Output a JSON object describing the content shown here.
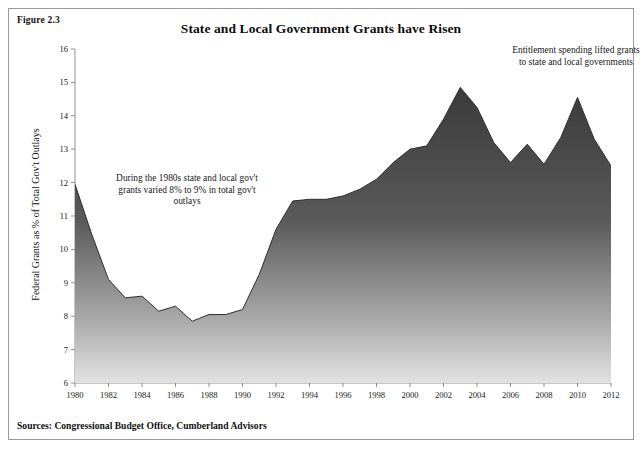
{
  "figure": {
    "label": "Figure 2.3",
    "title": "State and Local Government Grants have Risen",
    "sources": "Sources: Congressional Budget Office, Cumberland Advisors"
  },
  "annotations": {
    "left": "During the 1980s state and local gov't grants varied 8% to 9% in total gov't outlays",
    "right": "Entitlement spending lifted grants to state and local governments"
  },
  "colors": {
    "area_top": "#3b3b3b",
    "area_bottom": "#d8d8d8",
    "axis": "#8f8f8f",
    "text": "#141414",
    "border": "#9a9a9a",
    "background": "#ffffff"
  },
  "chart_data": {
    "type": "area",
    "title": "State and Local Government Grants have Risen",
    "xlabel": "",
    "ylabel": "Federal Grants as % of Total Gov't Outlays",
    "xlim": [
      1980,
      2012
    ],
    "ylim": [
      6,
      16
    ],
    "ytick_labels": [
      "6",
      "7",
      "8",
      "9",
      "10",
      "11",
      "12",
      "13",
      "14",
      "15",
      "16"
    ],
    "yticks": [
      6,
      7,
      8,
      9,
      10,
      11,
      12,
      13,
      14,
      15,
      16
    ],
    "xtick_labels": [
      "1980",
      "1982",
      "1984",
      "1986",
      "1988",
      "1990",
      "1992",
      "1994",
      "1996",
      "1998",
      "2000",
      "2002",
      "2004",
      "2006",
      "2008",
      "2010",
      "2012"
    ],
    "xticks": [
      1980,
      1982,
      1984,
      1986,
      1988,
      1990,
      1992,
      1994,
      1996,
      1998,
      2000,
      2002,
      2004,
      2006,
      2008,
      2010,
      2012
    ],
    "grid": false,
    "legend": "none",
    "x": [
      1980,
      1981,
      1982,
      1983,
      1984,
      1985,
      1986,
      1987,
      1988,
      1989,
      1990,
      1991,
      1992,
      1993,
      1994,
      1995,
      1996,
      1997,
      1998,
      1999,
      2000,
      2001,
      2002,
      2003,
      2004,
      2005,
      2006,
      2007,
      2008,
      2009,
      2010,
      2011,
      2012
    ],
    "values": [
      11.95,
      10.45,
      9.1,
      8.55,
      8.6,
      8.15,
      8.3,
      7.85,
      8.05,
      8.05,
      8.2,
      9.25,
      10.6,
      11.45,
      11.5,
      11.5,
      11.6,
      11.8,
      12.1,
      12.6,
      13.0,
      13.1,
      13.9,
      14.85,
      14.25,
      13.2,
      12.6,
      13.15,
      12.55,
      13.35,
      14.55,
      13.3,
      12.5
    ],
    "series": [
      {
        "name": "Federal Grants as % of Total Gov't Outlays",
        "values": [
          11.95,
          10.45,
          9.1,
          8.55,
          8.6,
          8.15,
          8.3,
          7.85,
          8.05,
          8.05,
          8.2,
          9.25,
          10.6,
          11.45,
          11.5,
          11.5,
          11.6,
          11.8,
          12.1,
          12.6,
          13.0,
          13.1,
          13.9,
          14.85,
          14.25,
          13.2,
          12.6,
          13.15,
          12.55,
          13.35,
          14.55,
          13.3,
          12.5
        ]
      }
    ],
    "peak": {
      "year": 2003,
      "value": 14.85
    },
    "trough": {
      "year": 1987,
      "value": 7.85
    }
  }
}
